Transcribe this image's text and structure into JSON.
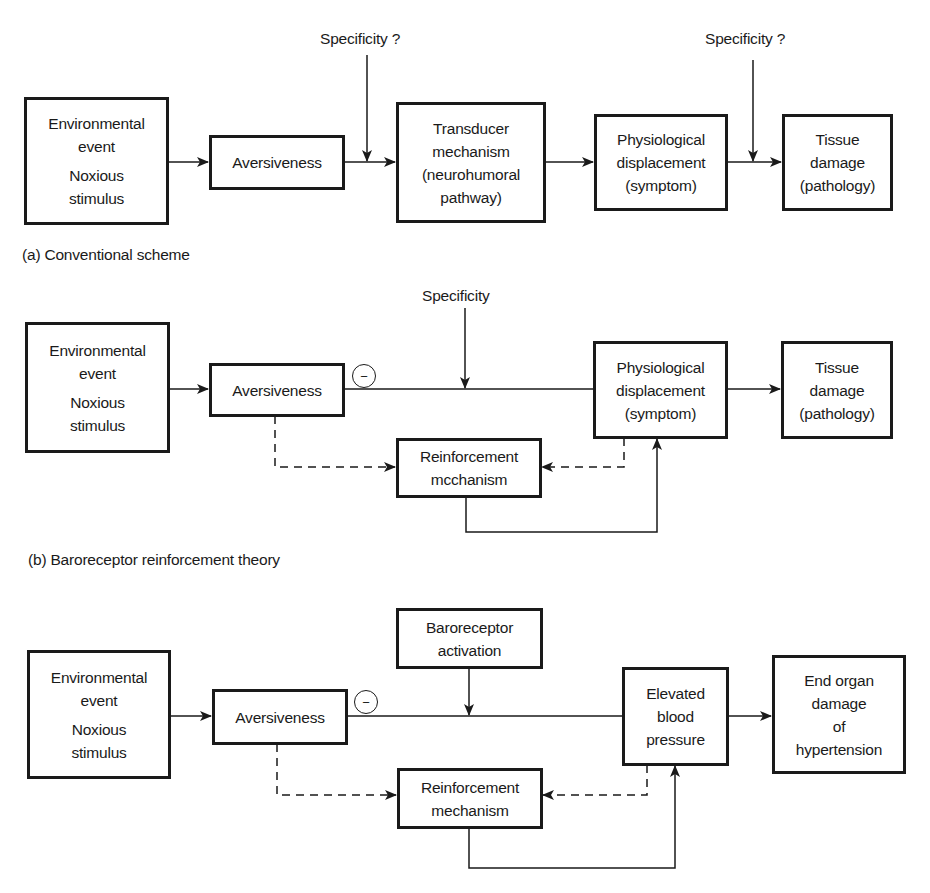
{
  "panels": {
    "a": {
      "caption": "(a)  Conventional scheme",
      "nodes": {
        "environment": [
          "Environmental",
          "event",
          "Noxious",
          "stimulus"
        ],
        "aversiveness": [
          "Aversiveness"
        ],
        "transducer": [
          "Transducer",
          "mechanism",
          "(neurohumoral",
          "pathway)"
        ],
        "physiological": [
          "Physiological",
          "displacement",
          "(symptom)"
        ],
        "tissue": [
          "Tissue",
          "damage",
          "(pathology)"
        ]
      },
      "labels": {
        "specificity_1": "Specificity ?",
        "specificity_2": "Specificity ?"
      }
    },
    "b": {
      "caption": "(b)  Baroreceptor reinforcement theory",
      "nodes": {
        "environment": [
          "Environmental",
          "event",
          "Noxious",
          "stimulus"
        ],
        "aversiveness": [
          "Aversiveness"
        ],
        "physiological": [
          "Physiological",
          "displacement",
          "(symptom)"
        ],
        "tissue": [
          "Tissue",
          "damage",
          "(pathology)"
        ],
        "reinforcement": [
          "Reinforcement",
          "mcchanism"
        ]
      },
      "labels": {
        "specificity": "Specificity",
        "inhibition": "−"
      }
    },
    "c": {
      "nodes": {
        "environment": [
          "Environmental",
          "event",
          "Noxious",
          "stimulus"
        ],
        "aversiveness": [
          "Aversiveness"
        ],
        "baroreceptor": [
          "Baroreceptor",
          "activation"
        ],
        "elevated_bp": [
          "Elevated",
          "blood",
          "pressure"
        ],
        "end_organ": [
          "End organ",
          "damage",
          "of",
          "hypertension"
        ],
        "reinforcement": [
          "Reinforcement",
          "mechanism"
        ]
      },
      "labels": {
        "inhibition": "−"
      }
    }
  },
  "colors": {
    "ink": "#1a1a1a",
    "background": "#ffffff"
  }
}
